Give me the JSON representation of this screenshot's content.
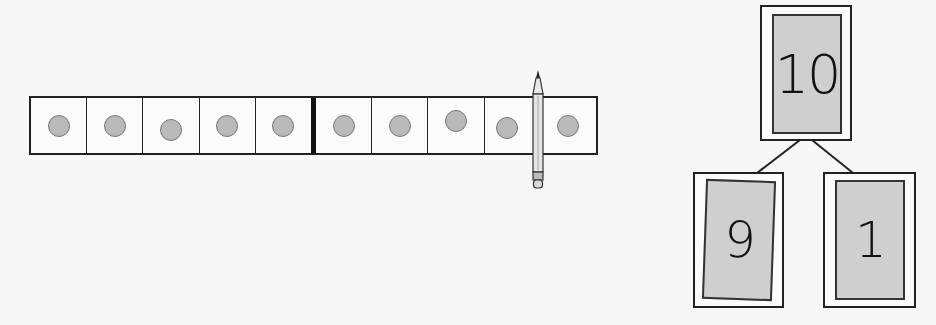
{
  "ten_frame": {
    "cells": 10,
    "filled": 10,
    "divider_after": 5,
    "counter_color": "#b9b9b9"
  },
  "pencil": {
    "position_after_cell": 9
  },
  "number_bond": {
    "whole": "10",
    "parts": [
      "9",
      "1"
    ],
    "card_fill": "#cfcfcf"
  }
}
